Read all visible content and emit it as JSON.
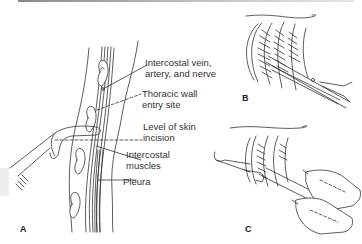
{
  "figure": {
    "panels": [
      {
        "id": "A",
        "label": "A"
      },
      {
        "id": "B",
        "label": "B"
      },
      {
        "id": "C",
        "label": "C"
      }
    ],
    "panel_a_labels": [
      {
        "id": "vessels",
        "text": "Intercostal vein,\nartery, and nerve"
      },
      {
        "id": "entry",
        "text": "Thoracic wall\nentry site"
      },
      {
        "id": "incision",
        "text": "Level of skin\nincision"
      },
      {
        "id": "muscles",
        "text": "Intercostal\nmuscles"
      },
      {
        "id": "pleura",
        "text": "Pleura"
      }
    ],
    "colors": {
      "line": "#333333",
      "background": "#ffffff",
      "topbar": "#9a9a9a",
      "sidebox": "#eeeeee"
    }
  }
}
